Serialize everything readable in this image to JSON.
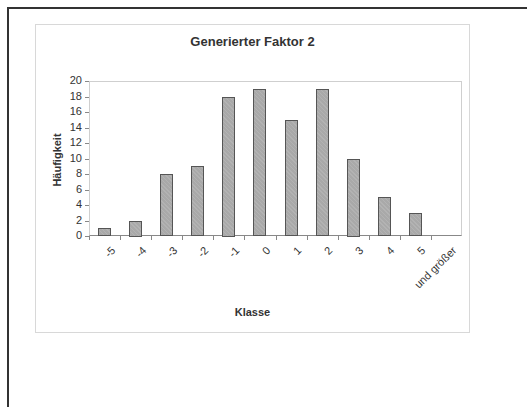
{
  "chart_data": {
    "type": "bar",
    "title": "Generierter Faktor 2",
    "xlabel": "Klasse",
    "ylabel": "Häufigkeit",
    "categories": [
      "-5",
      "-4",
      "-3",
      "-2",
      "-1",
      "0",
      "1",
      "2",
      "3",
      "4",
      "5",
      "und größer"
    ],
    "values": [
      1,
      2,
      8,
      9,
      18,
      19,
      15,
      19,
      10,
      5,
      3,
      0
    ],
    "ylim": [
      0,
      20
    ],
    "yticks": [
      0,
      2,
      4,
      6,
      8,
      10,
      12,
      14,
      16,
      18,
      20
    ],
    "grid": false,
    "legend": null,
    "bar_color": "#a9a9a9",
    "bar_edge_color": "#555555"
  }
}
